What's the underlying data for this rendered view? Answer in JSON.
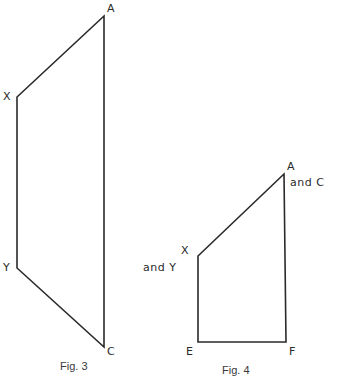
{
  "figures": [
    {
      "id": "fig3",
      "caption": "Fig. 3",
      "vertices": {
        "A": {
          "label": "A",
          "x": 104,
          "y": 16
        },
        "X": {
          "label": "X",
          "x": 17,
          "y": 97
        },
        "Y": {
          "label": "Y",
          "x": 17,
          "y": 268
        },
        "C": {
          "label": "C",
          "x": 104,
          "y": 347
        }
      },
      "edges": [
        [
          "A",
          "X"
        ],
        [
          "X",
          "Y"
        ],
        [
          "Y",
          "C"
        ],
        [
          "C",
          "A"
        ]
      ]
    },
    {
      "id": "fig4",
      "caption": "Fig. 4",
      "vertices": {
        "AC": {
          "label": "A",
          "sublabel": "and C",
          "x": 284,
          "y": 174
        },
        "XY": {
          "label": "X",
          "sublabel": "and Y",
          "x": 198,
          "y": 256
        },
        "E": {
          "label": "E",
          "x": 198,
          "y": 342
        },
        "F": {
          "label": "F",
          "x": 286,
          "y": 342
        }
      },
      "edges": [
        [
          "AC",
          "XY"
        ],
        [
          "XY",
          "E"
        ],
        [
          "E",
          "F"
        ],
        [
          "F",
          "AC"
        ]
      ]
    }
  ],
  "style": {
    "stroke_color": "#2a2a2a",
    "background": "#ffffff"
  }
}
